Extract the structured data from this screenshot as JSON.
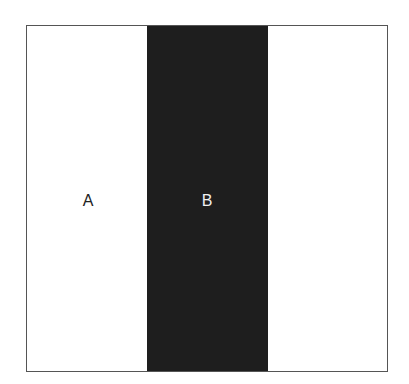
{
  "diagram": {
    "regions": [
      {
        "id": "A",
        "label": "A",
        "color": "#ffffff"
      },
      {
        "id": "B",
        "label": "B",
        "color": "#1e1e1e"
      },
      {
        "id": "C",
        "label": "",
        "color": "#ffffff"
      }
    ]
  }
}
